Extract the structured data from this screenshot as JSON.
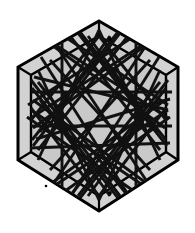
{
  "figure": {
    "canvas": {
      "width": 195,
      "height": 233
    },
    "colors": {
      "background": "#ffffff",
      "face_fill": "#c9c9c9",
      "bevel_fill": "#d2d2d2",
      "outline": "#000000",
      "web_line": "#111111",
      "dot": "#000000"
    },
    "outer_hexagon": {
      "name": "outer-hexagon",
      "points": [
        [
          99,
          21
        ],
        [
          178,
          67
        ],
        [
          178,
          160
        ],
        [
          99,
          211
        ],
        [
          18,
          160
        ],
        [
          18,
          67
        ]
      ],
      "stroke_width": 3
    },
    "inner_hexagon": {
      "name": "inner-hexagon-face",
      "points": [
        [
          99,
          36
        ],
        [
          166,
          75
        ],
        [
          166,
          152
        ],
        [
          99,
          196
        ],
        [
          31,
          152
        ],
        [
          31,
          75
        ]
      ],
      "stroke_width": 2.4
    },
    "bevel_edges": {
      "name": "bevel-connector-lines",
      "stroke_width": 2.2,
      "segments": [
        [
          [
            99,
            21
          ],
          [
            99,
            36
          ]
        ],
        [
          [
            178,
            67
          ],
          [
            166,
            75
          ]
        ],
        [
          [
            178,
            160
          ],
          [
            166,
            152
          ]
        ],
        [
          [
            99,
            211
          ],
          [
            99,
            196
          ]
        ],
        [
          [
            18,
            160
          ],
          [
            31,
            152
          ]
        ],
        [
          [
            18,
            67
          ],
          [
            31,
            75
          ]
        ]
      ]
    },
    "dots": [
      {
        "name": "bevel-dot-top",
        "cx": 110,
        "cy": 39,
        "r": 1.9
      },
      {
        "name": "bevel-dot-bottom",
        "cx": 110,
        "cy": 193,
        "r": 1.9
      },
      {
        "name": "bevel-dot-lower-left",
        "cx": 46,
        "cy": 186,
        "r": 1.3
      }
    ],
    "web": {
      "name": "string-art-web",
      "stroke_width": 2.9,
      "line_cap": "butt",
      "description": "Dense set of straight chords spanning the hexagonal face, overshooting the inner edge into the bevel band.",
      "segments": [
        [
          [
            31,
            92
          ],
          [
            172,
            92
          ]
        ],
        [
          [
            31,
            126
          ],
          [
            172,
            126
          ]
        ],
        [
          [
            30,
            148
          ],
          [
            170,
            143
          ]
        ],
        [
          [
            34,
            77
          ],
          [
            168,
            110
          ]
        ],
        [
          [
            36,
            139
          ],
          [
            170,
            99
          ]
        ],
        [
          [
            41,
            57
          ],
          [
            131,
            199
          ]
        ],
        [
          [
            159,
            57
          ],
          [
            69,
            199
          ]
        ],
        [
          [
            55,
            44
          ],
          [
            150,
            186
          ]
        ],
        [
          [
            147,
            44
          ],
          [
            52,
            186
          ]
        ],
        [
          [
            28,
            105
          ],
          [
            136,
            35
          ]
        ],
        [
          [
            168,
            105
          ],
          [
            62,
            35
          ]
        ],
        [
          [
            27,
            117
          ],
          [
            141,
            196
          ]
        ],
        [
          [
            170,
            117
          ],
          [
            58,
            196
          ]
        ],
        [
          [
            99,
            30
          ],
          [
            38,
            160
          ]
        ],
        [
          [
            99,
            30
          ],
          [
            160,
            160
          ]
        ],
        [
          [
            99,
            200
          ],
          [
            38,
            70
          ]
        ],
        [
          [
            99,
            200
          ],
          [
            160,
            70
          ]
        ],
        [
          [
            31,
            80
          ],
          [
            120,
            196
          ]
        ],
        [
          [
            168,
            80
          ],
          [
            78,
            196
          ]
        ],
        [
          [
            33,
            146
          ],
          [
            120,
            33
          ]
        ],
        [
          [
            167,
            146
          ],
          [
            78,
            33
          ]
        ],
        [
          [
            45,
            40
          ],
          [
            165,
            128
          ]
        ],
        [
          [
            153,
            40
          ],
          [
            33,
            128
          ]
        ],
        [
          [
            45,
            188
          ],
          [
            165,
            100
          ]
        ],
        [
          [
            153,
            188
          ],
          [
            33,
            100
          ]
        ],
        [
          [
            62,
            33
          ],
          [
            62,
            198
          ]
        ],
        [
          [
            136,
            33
          ],
          [
            136,
            198
          ]
        ],
        [
          [
            80,
            32
          ],
          [
            166,
            140
          ]
        ],
        [
          [
            118,
            32
          ],
          [
            32,
            140
          ]
        ],
        [
          [
            80,
            198
          ],
          [
            166,
            88
          ]
        ],
        [
          [
            118,
            198
          ],
          [
            32,
            88
          ]
        ],
        [
          [
            31,
            110
          ],
          [
            150,
            190
          ]
        ],
        [
          [
            168,
            110
          ],
          [
            48,
            190
          ]
        ],
        [
          [
            31,
            118
          ],
          [
            150,
            40
          ]
        ],
        [
          [
            168,
            118
          ],
          [
            48,
            40
          ]
        ],
        [
          [
            99,
            36
          ],
          [
            31,
            120
          ]
        ],
        [
          [
            99,
            36
          ],
          [
            166,
            120
          ]
        ],
        [
          [
            99,
            196
          ],
          [
            31,
            108
          ]
        ],
        [
          [
            99,
            196
          ],
          [
            166,
            108
          ]
        ],
        [
          [
            50,
            60
          ],
          [
            150,
            170
          ]
        ],
        [
          [
            150,
            60
          ],
          [
            50,
            170
          ]
        ],
        [
          [
            40,
            100
          ],
          [
            110,
            196
          ]
        ],
        [
          [
            158,
            100
          ],
          [
            88,
            196
          ]
        ],
        [
          [
            40,
            132
          ],
          [
            110,
            36
          ]
        ],
        [
          [
            158,
            132
          ],
          [
            88,
            36
          ]
        ],
        [
          [
            70,
            36
          ],
          [
            160,
            150
          ]
        ],
        [
          [
            128,
            36
          ],
          [
            38,
            150
          ]
        ],
        [
          [
            70,
            196
          ],
          [
            160,
            82
          ]
        ],
        [
          [
            128,
            196
          ],
          [
            38,
            82
          ]
        ]
      ]
    }
  }
}
